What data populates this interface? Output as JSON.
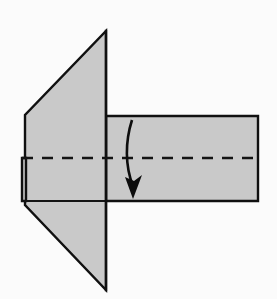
{
  "diagram": {
    "canvas": {
      "width": 277,
      "height": 299,
      "background": "#fbfbfb"
    },
    "colors": {
      "paper_fill": "#c9c9c9",
      "edge_stroke": "#101010",
      "fold_line": "#141414",
      "arrow": "#0d0d0d",
      "background": "#fbfbfb"
    },
    "shapes": {
      "left_pentagon": {
        "name": "left-folded-flap",
        "description": "Large pointed flap on the left formed by two triangles meeting at a vertical crease",
        "points": "106,31 106,290 25,205 25,115"
      },
      "right_rectangle": {
        "name": "right-paper-panel",
        "description": "Rectangular panel extending to the right of the vertical crease",
        "points": "106,116 258,116 258,201 106,201"
      },
      "small_left_tab": {
        "name": "left-edge-tab",
        "description": "Narrow vertical tab at the left edge below the horizontal fold line",
        "points": "22,158 22,201 26,201 26,158"
      }
    },
    "lines": {
      "vertical_crease": {
        "name": "vertical-crease-line",
        "from_x": 106,
        "from_y": 31,
        "to_x": 106,
        "to_y": 290
      },
      "horizontal_fold": {
        "name": "horizontal-fold-dashed-line",
        "style": "dashed",
        "dash_pattern": "11 9",
        "from_x": 22,
        "from_y": 158,
        "to_x": 258,
        "to_y": 158
      },
      "tab_bottom_edge": {
        "name": "tab-bottom-edge",
        "from_x": 22,
        "from_y": 201,
        "to_x": 106,
        "to_y": 201
      }
    },
    "arrow": {
      "name": "fold-direction-arrow",
      "direction": "downward",
      "meaning": "fold the flap down along the dashed line",
      "path": "M 132,120 C 125,142 125,166 133,186",
      "head_points": "133,199 125,177 134,181 142,175"
    }
  }
}
